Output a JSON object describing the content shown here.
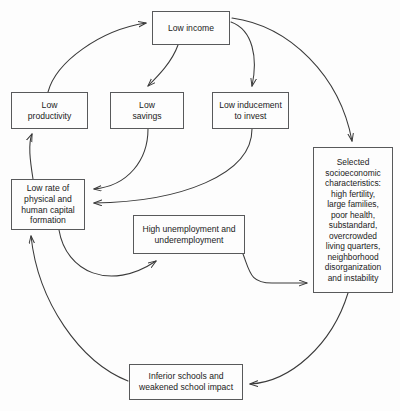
{
  "diagram": {
    "style": {
      "background": "#fdfdfd",
      "box_border": "#58595b",
      "edge_color": "#3a3a3a",
      "text_color": "#1b1b1b"
    },
    "nodes": [
      {
        "id": "low-income",
        "label": "Low income",
        "x": 152,
        "y": 11,
        "w": 78,
        "h": 34,
        "font_size": 8.6
      },
      {
        "id": "low-productivity",
        "label": "Low\nproductivity",
        "x": 11,
        "y": 92,
        "w": 77,
        "h": 37,
        "font_size": 8.6
      },
      {
        "id": "low-savings",
        "label": "Low\nsavings",
        "x": 110,
        "y": 92,
        "w": 74,
        "h": 37,
        "font_size": 8.6
      },
      {
        "id": "low-inducement-to-invest",
        "label": "Low inducement\nto invest",
        "x": 212,
        "y": 92,
        "w": 77,
        "h": 37,
        "font_size": 8.6
      },
      {
        "id": "selected-socioeconomic-characteristics",
        "label": "Selected\nsocioeconomic\ncharacteristics:\nhigh fertility,\nlarge families,\npoor health,\nsubstandard,\novercrowded\nliving quarters,\nneighborhood\ndisorganization\nand instability",
        "x": 313,
        "y": 147,
        "w": 80,
        "h": 146,
        "font_size": 8.4
      },
      {
        "id": "low-rate-of-capital-formation",
        "label": "Low rate of\nphysical and\nhuman capital\nformation",
        "x": 11,
        "y": 179,
        "w": 74,
        "h": 51,
        "font_size": 8.6
      },
      {
        "id": "high-unemployment",
        "label": "High unemployment and\nunderemployment",
        "x": 133,
        "y": 215,
        "w": 112,
        "h": 39,
        "font_size": 8.6
      },
      {
        "id": "inferior-schools",
        "label": "Inferior schools and\nweakened school impact",
        "x": 129,
        "y": 364,
        "w": 114,
        "h": 36,
        "font_size": 8.6
      }
    ],
    "edges": [
      {
        "id": "edge-productivity-to-income",
        "from": "low-productivity",
        "to": "low-income",
        "path": "M 48 92 C 56 62 100 30 146 23"
      },
      {
        "id": "edge-income-to-savings",
        "from": "low-income",
        "to": "low-savings",
        "path": "M 178 45 C 172 62 158 76 148 86"
      },
      {
        "id": "edge-income-to-inducement",
        "from": "low-income",
        "to": "low-inducement",
        "path": "M 231 22 C 253 30 258 58 252 86"
      },
      {
        "id": "edge-income-to-socioeconomic",
        "from": "low-income",
        "to": "selected-socioeconomic",
        "path": "M 232 18 C 290 26 340 76 352 141"
      },
      {
        "id": "edge-savings-to-capital",
        "from": "low-savings",
        "to": "low-rate-of-capital-formation",
        "path": "M 148 129 C 148 160 128 186 94 189"
      },
      {
        "id": "edge-inducement-to-capital",
        "from": "low-inducement",
        "to": "low-rate-of-capital-formation",
        "path": "M 252 129 C 252 175 180 202 94 203"
      },
      {
        "id": "edge-capital-to-productivity",
        "from": "low-rate-of-capital-formation",
        "to": "low-productivity",
        "path": "M 33 179 C 30 160 28 144 32 134"
      },
      {
        "id": "edge-capital-to-unemployment",
        "from": "low-rate-of-capital-formation",
        "to": "high-unemployment",
        "path": "M 59 230 C 66 272 110 292 156 261"
      },
      {
        "id": "edge-unemployment-to-socioeconomic",
        "from": "high-unemployment",
        "to": "selected-socioeconomic",
        "path": "M 243 254 C 250 272 250 283 272 283 L 307 283"
      },
      {
        "id": "edge-socioeconomic-to-schools",
        "from": "selected-socioeconomic",
        "to": "inferior-schools",
        "path": "M 348 293 C 332 345 290 382 250 384"
      },
      {
        "id": "edge-schools-to-capital",
        "from": "inferior-schools",
        "to": "low-rate-of-capital-formation",
        "path": "M 128 381 C 80 362 38 302 31 236"
      }
    ]
  }
}
